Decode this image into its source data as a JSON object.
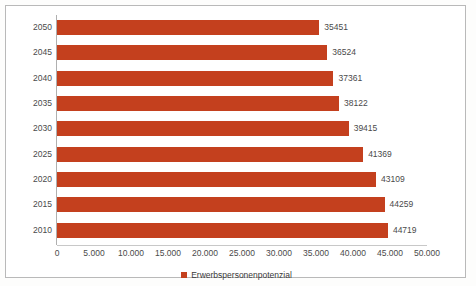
{
  "chart_data": {
    "type": "bar",
    "orientation": "horizontal",
    "title": "",
    "xlabel": "",
    "ylabel": "",
    "categories": [
      "2050",
      "2045",
      "2040",
      "2035",
      "2030",
      "2025",
      "2020",
      "2015",
      "2010"
    ],
    "series": [
      {
        "name": "Erwerbspersonenpotenzial",
        "color": "#c4401e",
        "values": [
          35451,
          36524,
          37361,
          38122,
          39415,
          41369,
          43109,
          44259,
          44719
        ]
      }
    ],
    "value_labels": [
      "35451",
      "36524",
      "37361",
      "38122",
      "39415",
      "41369",
      "43109",
      "44259",
      "44719"
    ],
    "xlim": [
      0,
      50000
    ],
    "xticks": [
      0,
      5000,
      10000,
      15000,
      20000,
      25000,
      30000,
      35000,
      40000,
      45000,
      50000
    ],
    "xtick_labels": [
      "0",
      "5.000",
      "10.000",
      "15.000",
      "20.000",
      "25.000",
      "30.000",
      "35.000",
      "40.000",
      "45.000",
      "50.000"
    ],
    "grid": false,
    "legend": {
      "position": "bottom",
      "entries": [
        {
          "label": "Erwerbspersonenpotenzial",
          "color": "#c4401e",
          "marker": "square"
        }
      ]
    }
  },
  "colors": {
    "bar": "#c4401e",
    "axis": "#b0b0b0",
    "text": "#4a4a4a",
    "frame": "#b9b9b9",
    "background": "#ffffff"
  }
}
